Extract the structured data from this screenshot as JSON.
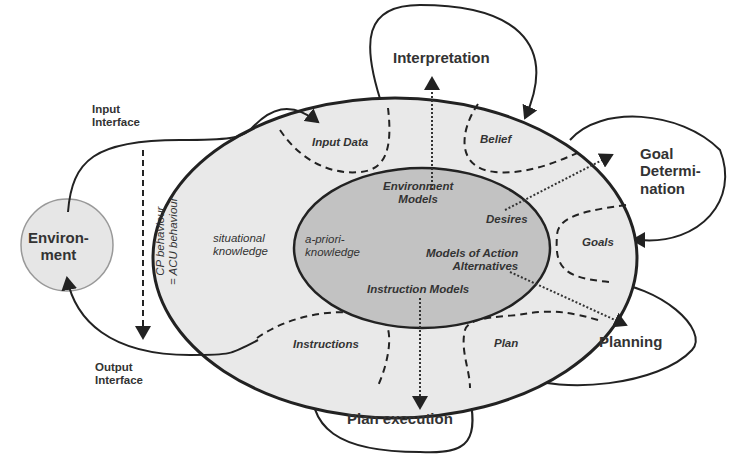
{
  "colors": {
    "outer_ellipse": "#e9e9e9",
    "inner_ellipse": "#c2c2c2",
    "environment": "#e6e6e6",
    "stroke": "#222222"
  },
  "environment": {
    "line1": "Environ-",
    "line2": "ment"
  },
  "input_interface": {
    "line1": "Input",
    "line2": "Interface"
  },
  "output_interface": {
    "line1": "Output",
    "line2": "Interface"
  },
  "behaviour": {
    "line1": "CP behaviour",
    "line2": "= ACU behaviour"
  },
  "outer": {
    "label_line1": "situational",
    "label_line2": "knowledge"
  },
  "inner": {
    "label_line1": "a-priori-",
    "label_line2": "knowledge",
    "environment_models_1": "Environment",
    "environment_models_2": "Models",
    "desires": "Desires",
    "action_models_1": "Models of Action",
    "action_models_2": "Alternatives",
    "instruction_models": "Instruction Models"
  },
  "regions": {
    "input_data": "Input Data",
    "belief": "Belief",
    "goals": "Goals",
    "plan": "Plan",
    "instructions": "Instructions"
  },
  "processes": {
    "interpretation": "Interpretation",
    "goal_determination_1": "Goal",
    "goal_determination_2": "Determi-",
    "goal_determination_3": "nation",
    "planning": "Planning",
    "plan_execution": "Plan execution"
  }
}
